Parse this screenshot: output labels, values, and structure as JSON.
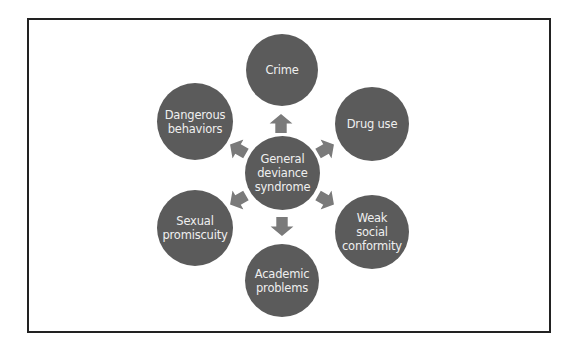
{
  "diagram": {
    "center": {
      "label": "General\ndeviance\nsyndrome"
    },
    "outcomes": [
      {
        "id": "crime",
        "label": "Crime"
      },
      {
        "id": "drug-use",
        "label": "Drug use"
      },
      {
        "id": "weak-social-conformity",
        "label": "Weak\nsocial\nconformity"
      },
      {
        "id": "academic-problems",
        "label": "Academic\nproblems"
      },
      {
        "id": "sexual-promiscuity",
        "label": "Sexual\npromiscuity"
      },
      {
        "id": "dangerous-behaviors",
        "label": "Dangerous\nbehaviors"
      }
    ],
    "colors": {
      "node_fill": "#5b5b5b",
      "arrow_fill": "#7a7a7a",
      "text": "#efefef",
      "frame_border": "#222222"
    }
  }
}
